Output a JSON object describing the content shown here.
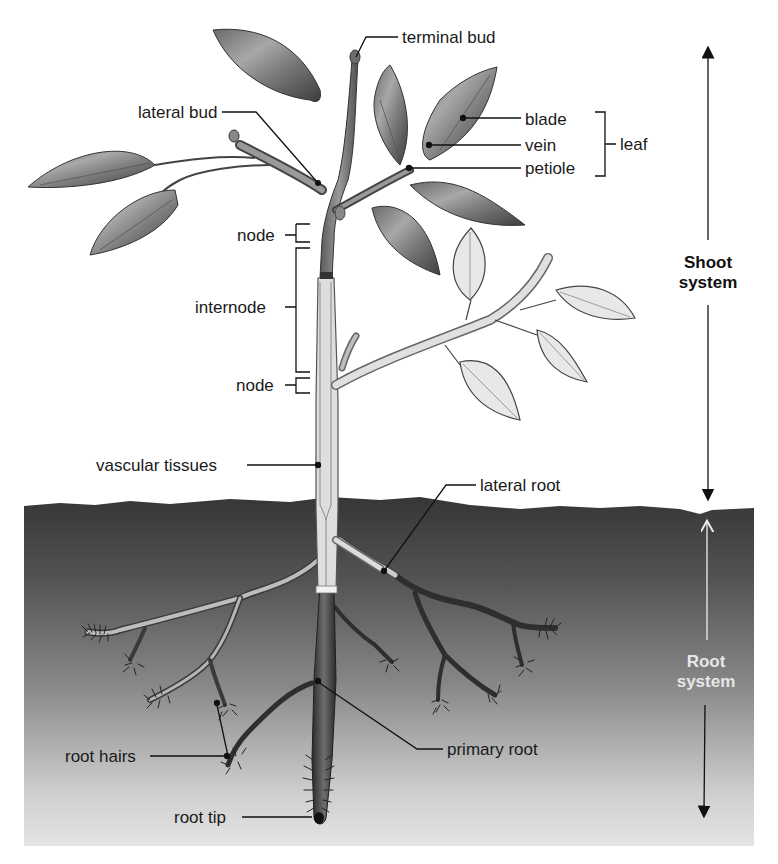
{
  "figure": {
    "colors": {
      "background": "#ffffff",
      "soil_top": "#3a3a3a",
      "soil_bottom": "#dcdcdc",
      "dark_stem": "#4a4a4a",
      "young_stem": "#d9d9d9",
      "label_text": "#1a1a1a",
      "root_system_text": "#e6e6e6"
    }
  },
  "labels": {
    "terminal_bud": "terminal bud",
    "lateral_bud": "lateral bud",
    "blade": "blade",
    "vein": "vein",
    "petiole": "petiole",
    "leaf": "leaf",
    "node_upper": "node",
    "internode": "internode",
    "node_lower": "node",
    "vascular_tissues": "vascular tissues",
    "lateral_root": "lateral root",
    "root_hairs": "root hairs",
    "primary_root": "primary root",
    "root_tip": "root tip"
  },
  "systems": {
    "shoot": {
      "line1": "Shoot",
      "line2": "system"
    },
    "root": {
      "line1": "Root",
      "line2": "system"
    }
  }
}
